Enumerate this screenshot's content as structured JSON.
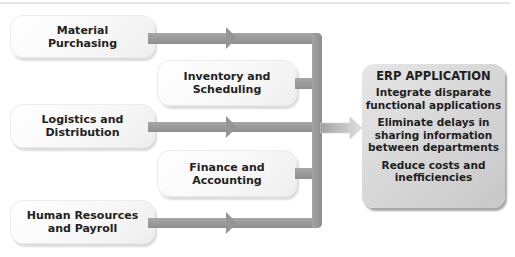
{
  "diagram": {
    "source_boxes": [
      {
        "id": "material-purchasing",
        "label": "Material\nPurchasing"
      },
      {
        "id": "inventory-scheduling",
        "label": "Inventory and\nScheduling"
      },
      {
        "id": "logistics-distribution",
        "label": "Logistics and\nDistribution"
      },
      {
        "id": "finance-accounting",
        "label": "Finance and\nAccounting"
      },
      {
        "id": "human-resources-payroll",
        "label": "Human Resources\nand Payroll"
      }
    ],
    "target": {
      "title": "ERP APPLICATION",
      "benefits": [
        "Integrate disparate\nfunctional applications",
        "Eliminate delays in\nsharing information\nbetween departments",
        "Reduce costs and\ninefficiencies"
      ]
    },
    "colors": {
      "connector": "#959595",
      "erp_box": "#d4d4d4",
      "source_box": "#f7f7f7",
      "text": "#222222"
    }
  }
}
